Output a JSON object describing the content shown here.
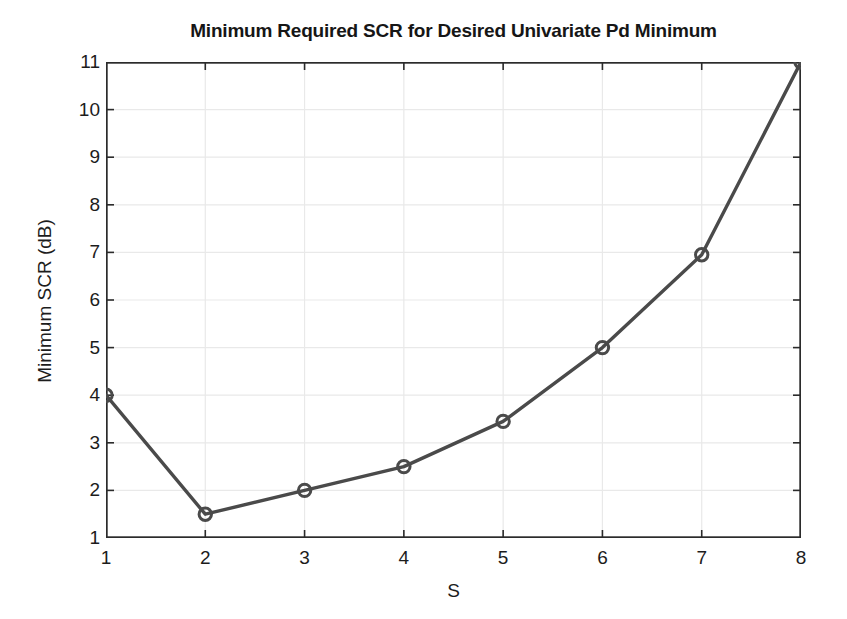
{
  "chart_data": {
    "type": "line",
    "title": "Minimum Required SCR for Desired Univariate Pd Minimum",
    "xlabel": "S",
    "ylabel": "Minimum SCR (dB)",
    "x": [
      1,
      2,
      3,
      4,
      5,
      6,
      7,
      8
    ],
    "values": [
      4.0,
      1.5,
      2.0,
      2.5,
      3.45,
      5.0,
      6.95,
      11.0
    ],
    "series": [
      {
        "name": "Minimum SCR",
        "values": [
          4.0,
          1.5,
          2.0,
          2.5,
          3.45,
          5.0,
          6.95,
          11.0
        ]
      }
    ],
    "xlim": [
      1,
      8
    ],
    "ylim": [
      1,
      11
    ],
    "xticks": [
      "1",
      "2",
      "3",
      "4",
      "5",
      "6",
      "7",
      "8"
    ],
    "yticks": [
      "1",
      "2",
      "3",
      "4",
      "5",
      "6",
      "7",
      "8",
      "9",
      "10",
      "11"
    ],
    "grid": true,
    "legend": null,
    "marker": "circle-open",
    "line_color": "#4a4a4a",
    "marker_color": "#4a4a4a",
    "grid_color": "#e9e9e9",
    "axis_color": "#2b2b2b",
    "background": "#ffffff"
  }
}
